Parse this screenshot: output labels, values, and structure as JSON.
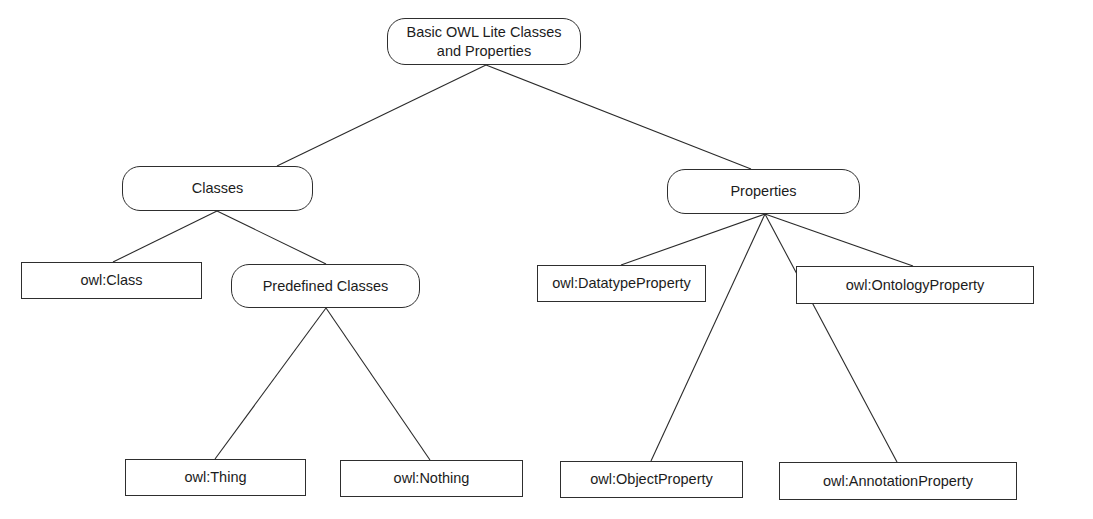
{
  "diagram": {
    "type": "tree",
    "nodes": [
      {
        "id": "root",
        "label": "Basic OWL Lite Classes\nand Properties",
        "shape": "rounded",
        "x": 387,
        "y": 18,
        "w": 194,
        "h": 47
      },
      {
        "id": "classes",
        "label": "Classes",
        "shape": "rounded",
        "x": 122,
        "y": 166,
        "w": 191,
        "h": 45
      },
      {
        "id": "properties",
        "label": "Properties",
        "shape": "rounded",
        "x": 667,
        "y": 169,
        "w": 193,
        "h": 45
      },
      {
        "id": "owl-class",
        "label": "owl:Class",
        "shape": "rect",
        "x": 21,
        "y": 262,
        "w": 181,
        "h": 37
      },
      {
        "id": "predefined-classes",
        "label": "Predefined Classes",
        "shape": "rounded",
        "x": 231,
        "y": 264,
        "w": 189,
        "h": 44
      },
      {
        "id": "owl-datatypeproperty",
        "label": "owl:DatatypeProperty",
        "shape": "rect",
        "x": 537,
        "y": 265,
        "w": 169,
        "h": 37
      },
      {
        "id": "owl-ontologyproperty",
        "label": "owl:OntologyProperty",
        "shape": "rect",
        "x": 796,
        "y": 266,
        "w": 238,
        "h": 38
      },
      {
        "id": "owl-thing",
        "label": "owl:Thing",
        "shape": "rect",
        "x": 125,
        "y": 459,
        "w": 181,
        "h": 37
      },
      {
        "id": "owl-nothing",
        "label": "owl:Nothing",
        "shape": "rect",
        "x": 340,
        "y": 460,
        "w": 183,
        "h": 37
      },
      {
        "id": "owl-objectproperty",
        "label": "owl:ObjectProperty",
        "shape": "rect",
        "x": 560,
        "y": 461,
        "w": 183,
        "h": 37
      },
      {
        "id": "owl-annotationproperty",
        "label": "owl:AnnotationProperty",
        "shape": "rect",
        "x": 779,
        "y": 462,
        "w": 238,
        "h": 38
      }
    ],
    "edges": [
      {
        "from": "root",
        "to": "classes",
        "x1": 486,
        "y1": 65,
        "x2": 277,
        "y2": 166
      },
      {
        "from": "root",
        "to": "properties",
        "x1": 486,
        "y1": 65,
        "x2": 751,
        "y2": 169
      },
      {
        "from": "classes",
        "to": "owl-class",
        "x1": 217,
        "y1": 211,
        "x2": 113,
        "y2": 262
      },
      {
        "from": "classes",
        "to": "predefined-classes",
        "x1": 217,
        "y1": 211,
        "x2": 326,
        "y2": 264
      },
      {
        "from": "predefined-classes",
        "to": "owl-thing",
        "x1": 326,
        "y1": 308,
        "x2": 215,
        "y2": 459
      },
      {
        "from": "predefined-classes",
        "to": "owl-nothing",
        "x1": 326,
        "y1": 308,
        "x2": 430,
        "y2": 460
      },
      {
        "from": "properties",
        "to": "owl-datatypeproperty",
        "x1": 765,
        "y1": 214,
        "x2": 621,
        "y2": 265
      },
      {
        "from": "properties",
        "to": "owl-objectproperty",
        "x1": 765,
        "y1": 214,
        "x2": 651,
        "y2": 461
      },
      {
        "from": "properties",
        "to": "owl-annotationproperty",
        "x1": 765,
        "y1": 214,
        "x2": 897,
        "y2": 462
      },
      {
        "from": "properties",
        "to": "owl-ontologyproperty",
        "x1": 765,
        "y1": 214,
        "x2": 913,
        "y2": 266
      }
    ]
  },
  "labels": {
    "root": "Basic OWL Lite Classes\nand Properties",
    "classes": "Classes",
    "properties": "Properties",
    "owl_class": "owl:Class",
    "predefined_classes": "Predefined Classes",
    "owl_datatypeproperty": "owl:DatatypeProperty",
    "owl_ontologyproperty": "owl:OntologyProperty",
    "owl_thing": "owl:Thing",
    "owl_nothing": "owl:Nothing",
    "owl_objectproperty": "owl:ObjectProperty",
    "owl_annotationproperty": "owl:AnnotationProperty"
  },
  "colors": {
    "line": "#2a2a2a",
    "border": "#2e2e2e",
    "background": "#ffffff",
    "text": "#1c1c1c"
  }
}
